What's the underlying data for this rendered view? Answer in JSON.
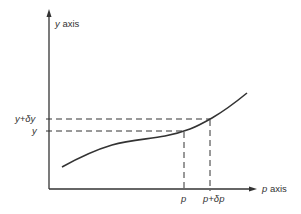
{
  "diagram": {
    "type": "function-curve-with-increments",
    "colors": {
      "line": "#333333",
      "background": "#ffffff"
    },
    "axes": {
      "y_label_var": "y",
      "y_label_word": "axis",
      "x_label_var": "p",
      "x_label_word": "axis"
    },
    "y_ticks": [
      {
        "id": "y-plus-delta-y",
        "label_parts": [
          "y",
          "+",
          "δ",
          "y"
        ]
      },
      {
        "id": "y",
        "label_parts": [
          "y"
        ]
      }
    ],
    "x_ticks": [
      {
        "id": "p",
        "label_parts": [
          "p"
        ]
      },
      {
        "id": "p-plus-delta-p",
        "label_parts": [
          "p",
          "+",
          "δ",
          "p"
        ]
      }
    ]
  }
}
